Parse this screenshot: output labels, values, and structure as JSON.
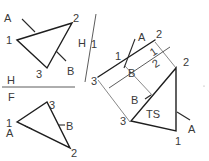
{
  "colors": {
    "object_line": "#1e1e1e",
    "projection_line": "#6a6a6a",
    "label": "#3a3a3a",
    "background": "#ffffff"
  },
  "views": {
    "top": {
      "labels": {
        "p1": "1",
        "p2": "2",
        "p3": "3",
        "a": "A",
        "b": "B"
      }
    },
    "front": {
      "labels": {
        "p1": "1",
        "p2": "2",
        "p3": "3",
        "a": "A",
        "b": "B"
      }
    },
    "edge": {
      "labels": {
        "p1": "1",
        "p2": "2",
        "p3": "3",
        "a": "A",
        "b": "B"
      }
    },
    "true_shape": {
      "labels": {
        "p1": "1",
        "p2": "2",
        "p3": "3",
        "a": "A",
        "b": "B",
        "ts": "TS"
      }
    }
  },
  "fold_lines": {
    "hf": {
      "upper": "H",
      "lower": "F"
    },
    "h1": {
      "left": "H",
      "right": "1"
    },
    "one_two": {
      "left": "1",
      "right": "2"
    }
  }
}
